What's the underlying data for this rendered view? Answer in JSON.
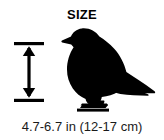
{
  "card": {
    "title": "SIZE",
    "caption": "4.7-6.7 in (12-17 cm)",
    "background_color": "#ffffff",
    "ink_color": "#000000"
  },
  "measurement": {
    "icon": "vertical-double-arrow-icon",
    "description": "vertical double-headed measurement arrow with end caps",
    "orientation": "vertical",
    "color": "#000000"
  },
  "subject": {
    "icon": "bird-silhouette-icon",
    "description": "solid black perching songbird silhouette facing left",
    "color": "#000000"
  }
}
